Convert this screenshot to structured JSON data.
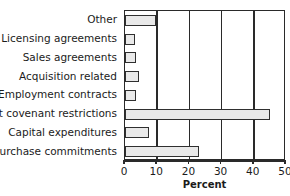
{
  "chart_data": {
    "type": "bar",
    "orientation": "horizontal",
    "title": "",
    "xlabel": "Percent",
    "ylabel": "",
    "categories": [
      "Other",
      "Licensing agreements",
      "Sales agreements",
      "Acquisition related",
      "Employment contracts",
      "Debt covenant restrictions",
      "Capital expenditures",
      "Purchase commitments"
    ],
    "values": [
      9.5,
      3,
      3.5,
      4.5,
      3.5,
      45,
      7.5,
      23
    ],
    "xlim": [
      0,
      50
    ],
    "xticks": [
      0,
      10,
      20,
      30,
      40,
      50
    ],
    "xtick_labels": [
      "0",
      "10",
      "20",
      "30",
      "40",
      "50"
    ],
    "gridlines": [
      10,
      20,
      30,
      40
    ],
    "grid": true,
    "legend": null,
    "bar_fill_color": "#e9e9e9",
    "bar_edge_color": "#2f2f2f",
    "axis_color": "#2a2a2a",
    "background_color": "#ffffff"
  }
}
